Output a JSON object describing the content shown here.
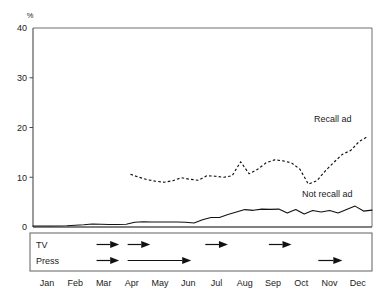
{
  "chart_data": {
    "type": "line",
    "title": "",
    "xlabel": "",
    "ylabel": "%",
    "ylim": [
      0,
      40
    ],
    "yticks": [
      0,
      10,
      20,
      30,
      40
    ],
    "ytick_labels": [
      "0",
      "10",
      "20",
      "30",
      "40"
    ],
    "grid": false,
    "legend_position": "inline-annotations",
    "categories": [
      "Jan",
      "Feb",
      "Mar",
      "Apr",
      "May",
      "Jun",
      "Jul",
      "Aug",
      "Sep",
      "Oct",
      "Nov",
      "Dec"
    ],
    "x_tick_labels": [
      "Jan",
      "Feb",
      "Mar",
      "Apr",
      "May",
      "Jun",
      "Jul",
      "Aug",
      "Sep",
      "Oct",
      "Nov",
      "Dec"
    ],
    "series": [
      {
        "name": "Recall ad",
        "style": "dashed",
        "label_x_month": "Nov",
        "label_value": 20,
        "x": [
          3.45,
          3.75,
          4.05,
          4.35,
          4.65,
          4.95,
          5.25,
          5.55,
          5.85,
          6.15,
          6.45,
          6.75,
          7.05,
          7.35,
          7.65,
          7.95,
          8.25,
          8.55,
          8.85,
          9.15,
          9.45,
          9.75,
          10.05,
          10.35,
          10.65,
          10.95,
          11.25,
          11.55,
          11.85
        ],
        "values": [
          10.6,
          10.0,
          9.5,
          9.2,
          9.0,
          9.3,
          9.9,
          9.6,
          9.4,
          10.3,
          10.2,
          10.0,
          10.3,
          13.1,
          10.7,
          11.6,
          12.9,
          13.5,
          13.3,
          12.9,
          11.6,
          8.6,
          9.3,
          11.3,
          13.0,
          14.6,
          15.4,
          17.2,
          18.2
        ]
      },
      {
        "name": "Not recall ad",
        "style": "solid",
        "label_x_month": "Oct",
        "label_value": 7,
        "x": [
          0.0,
          0.6,
          1.2,
          1.8,
          2.1,
          2.4,
          2.7,
          3.0,
          3.3,
          3.6,
          3.9,
          4.2,
          4.5,
          4.8,
          5.1,
          5.4,
          5.7,
          6.0,
          6.3,
          6.6,
          6.9,
          7.2,
          7.5,
          7.8,
          8.1,
          8.4,
          8.7,
          9.0,
          9.3,
          9.6,
          9.9,
          10.2,
          10.5,
          10.8,
          11.1,
          11.4,
          11.7,
          12.0
        ],
        "values": [
          0.2,
          0.2,
          0.25,
          0.45,
          0.6,
          0.55,
          0.5,
          0.5,
          0.55,
          0.95,
          1.05,
          1.0,
          1.0,
          1.0,
          1.0,
          0.95,
          0.8,
          1.45,
          1.9,
          1.9,
          2.5,
          3.0,
          3.5,
          3.35,
          3.6,
          3.55,
          3.6,
          2.8,
          3.5,
          2.6,
          3.3,
          3.0,
          3.3,
          2.8,
          3.5,
          4.2,
          3.2,
          3.4
        ]
      }
    ],
    "annotations": [
      {
        "text": "Recall ad",
        "x_month": "Nov",
        "value": 21.5
      },
      {
        "text": "Not recall ad",
        "x_month": "Oct",
        "value": 7.2
      }
    ]
  },
  "axis": {
    "unit_label": "%",
    "y_labels": [
      "40",
      "30",
      "20",
      "10",
      "0"
    ],
    "x_labels": [
      "Jan",
      "Feb",
      "Mar",
      "Apr",
      "May",
      "Jun",
      "Jul",
      "Aug",
      "Sep",
      "Oct",
      "Nov",
      "Dec"
    ]
  },
  "media_schedule": {
    "rows": [
      {
        "label": "TV",
        "bursts": [
          {
            "start_month": 2.25,
            "end_month": 3.05
          },
          {
            "start_month": 3.35,
            "end_month": 4.15
          },
          {
            "start_month": 6.1,
            "end_month": 6.9
          },
          {
            "start_month": 8.35,
            "end_month": 9.15
          }
        ]
      },
      {
        "label": "Press",
        "bursts": [
          {
            "start_month": 2.25,
            "end_month": 3.05
          },
          {
            "start_month": 3.35,
            "end_month": 5.6
          },
          {
            "start_month": 10.1,
            "end_month": 10.95
          }
        ]
      }
    ]
  },
  "colors": {
    "ink": "#111111",
    "axis": "#4a4a4a",
    "border": "#6e6e6e",
    "background": "#ffffff"
  }
}
